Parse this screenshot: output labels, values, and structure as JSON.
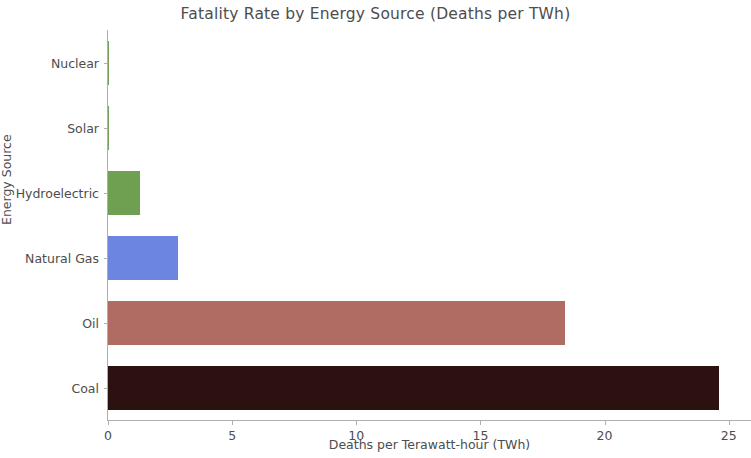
{
  "chart_data": {
    "type": "bar",
    "orientation": "horizontal",
    "title": "Fatality Rate by Energy Source (Deaths per TWh)",
    "xlabel": "Deaths per Terawatt-hour (TWh)",
    "ylabel": "Energy Source",
    "categories": [
      "Nuclear",
      "Solar",
      "Hydroelectric",
      "Natural Gas",
      "Oil",
      "Coal"
    ],
    "values": [
      0.03,
      0.02,
      1.3,
      2.8,
      18.4,
      24.6
    ],
    "xlim": [
      0,
      25.9
    ],
    "ylim": [
      0,
      6
    ],
    "xticks": [
      0,
      5,
      10,
      15,
      20,
      25
    ],
    "xticklabels": [
      "0",
      "5",
      "10",
      "15",
      "20",
      "25"
    ],
    "grid": false,
    "legend": false,
    "bar_colors": [
      "#7a9e5c",
      "#7a9e5c",
      "#6fa052",
      "#6c86e0",
      "#b06b63",
      "#2b1210"
    ],
    "colors": {
      "hydroelectric": "#6fa052",
      "natural_gas": "#6c86e0",
      "oil": "#b06b63",
      "coal": "#2b1210",
      "axis": "#b0b0b0",
      "text": "#4d4d4d",
      "background": "#ffffff"
    }
  }
}
